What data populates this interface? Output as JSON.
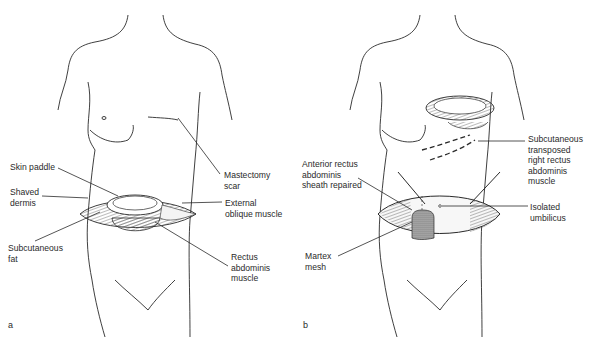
{
  "figure": {
    "panels": [
      {
        "letter": "a",
        "labels": {
          "skin_paddle": "Skin paddle",
          "shaved_dermis": "Shaved\ndermis",
          "subcutaneous_fat": "Subcutaneous\nfat",
          "mastectomy_scar": "Mastectomy\nscar",
          "external_oblique": "External\noblique muscle",
          "rectus_abdominis": "Rectus\nabdominis\nmuscle"
        }
      },
      {
        "letter": "b",
        "labels": {
          "anterior_rectus": "Anterior rectus\nabdominis\nsheath repaired",
          "martex_mesh": "Martex\nmesh",
          "subcutaneous_transposed": "Subcutaneous\ntransposed\nright rectus\nabdominis\nmuscle",
          "isolated_umbilicus": "Isolated\numbilicus"
        }
      }
    ],
    "colors": {
      "line": "#2a2a2a",
      "hatch": "#555555",
      "background": "#ffffff"
    }
  }
}
